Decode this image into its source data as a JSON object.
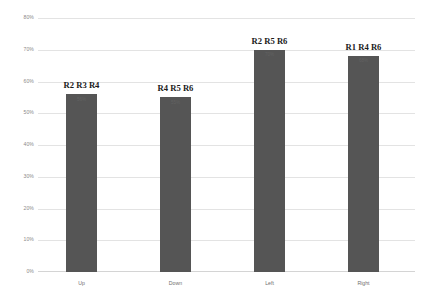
{
  "chart_data": {
    "type": "bar",
    "title": "",
    "subtitle": "",
    "xlabel": "",
    "ylabel": "",
    "categories": [
      "Up",
      "Down",
      "Left",
      "Right"
    ],
    "values": [
      56,
      55,
      70,
      68
    ],
    "value_labels": [
      "56%",
      "55%",
      "70%",
      "68%"
    ],
    "point_annotations": [
      "R2 R3 R4",
      "R4 R5 R6",
      "R2 R5 R6",
      "R1 R4 R6"
    ],
    "ylim": [
      0,
      80
    ],
    "y_tick_values": [
      0,
      10,
      20,
      30,
      40,
      50,
      60,
      70,
      80
    ],
    "y_tick_labels": [
      "0%",
      "10%",
      "20%",
      "30%",
      "40%",
      "50%",
      "60%",
      "70%",
      "80%"
    ],
    "grid": true,
    "legend": null,
    "bar_color": "#555555",
    "gridline_color": "#e3e3e3",
    "annotation_color": "#1a1a1a",
    "tick_label_color": "#8a8a8a"
  },
  "axis": {
    "y_labels": [
      "80%",
      "70%",
      "60%",
      "50%",
      "40%",
      "30%",
      "20%",
      "10%",
      "0%"
    ]
  },
  "bars": [
    {
      "category": "Up",
      "annotation": "R2 R3 R4",
      "value": 56,
      "value_label": "56%"
    },
    {
      "category": "Down",
      "annotation": "R4 R5 R6",
      "value": 55,
      "value_label": "55%"
    },
    {
      "category": "Left",
      "annotation": "R2 R5 R6",
      "value": 70,
      "value_label": "70%"
    },
    {
      "category": "Right",
      "annotation": "R1 R4 R6",
      "value": 68,
      "value_label": "68%"
    }
  ]
}
